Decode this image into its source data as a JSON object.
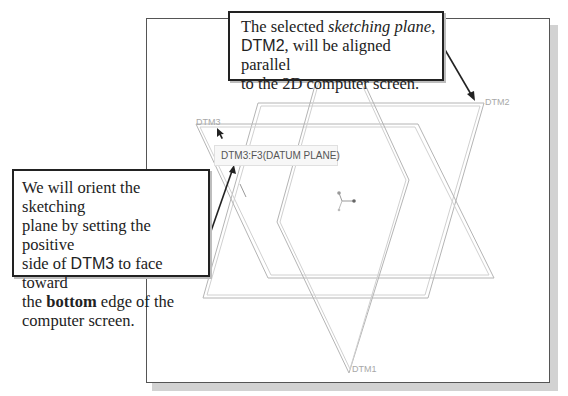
{
  "callouts": {
    "top": {
      "line1_a": "The selected ",
      "line1_em": "sketching plane",
      "line1_b": ",",
      "line2_sans": "DTM2",
      "line2_b": ", will be aligned parallel",
      "line3": "to the 2D computer screen."
    },
    "left": {
      "line1": "We will orient the sketching",
      "line2": "plane by setting the positive",
      "line3_a": "side of ",
      "line3_sans": "DTM3",
      "line3_b": " to face toward",
      "line4_a": "the ",
      "line4_bold": "bottom",
      "line4_b": " edge of the",
      "line5": "computer screen."
    }
  },
  "tooltip": {
    "text": "DTM3:F3(DATUM PLANE)"
  },
  "datum_labels": {
    "dtm1": "DTM1",
    "dtm2": "DTM2",
    "dtm3": "DTM3"
  },
  "colors": {
    "frame": "#555555",
    "plane_lines": "#b0b0b0",
    "callout_border": "#222222",
    "shadow": "#d2d2d2"
  },
  "icons": {
    "csys": "coordinate-system-triad",
    "cursor": "mouse-pointer-arrow"
  }
}
